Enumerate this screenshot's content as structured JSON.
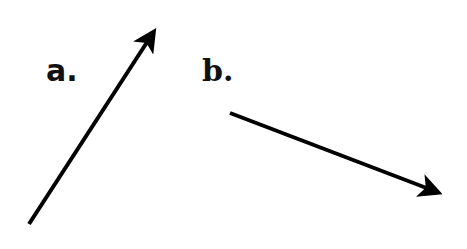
{
  "diagram": {
    "labels": {
      "a": "a.",
      "b": "b."
    },
    "arrows": [
      {
        "id": "a",
        "x1": 29,
        "y1": 224,
        "x2": 157,
        "y2": 27,
        "color": "#000000"
      },
      {
        "id": "b",
        "x1": 230,
        "y1": 113,
        "x2": 444,
        "y2": 195,
        "color": "#000000"
      }
    ]
  }
}
